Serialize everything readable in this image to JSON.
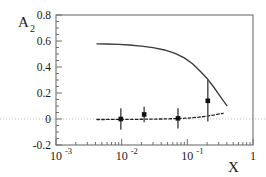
{
  "chart_data": {
    "type": "scatter",
    "title": "",
    "xlabel": "X",
    "ylabel": "A",
    "ylabel_sub": "2",
    "xscale": "log",
    "yscale": "linear",
    "xlim": [
      0.001,
      1.0
    ],
    "ylim": [
      -0.2,
      0.8
    ],
    "grid": false,
    "legend": "none",
    "yticks": [
      "0.8",
      "0.6",
      "0.4",
      "0.2",
      "0",
      "-0.2"
    ],
    "ytick_values": [
      0.8,
      0.6,
      0.4,
      0.2,
      0,
      -0.2
    ],
    "xticks": [
      {
        "label_base": "10",
        "label_exp": "-3",
        "value": 0.001
      },
      {
        "label_base": "10",
        "label_exp": "-2",
        "value": 0.01
      },
      {
        "label_base": "10",
        "label_exp": "-1",
        "value": 0.1
      },
      {
        "label_base": "1",
        "label_exp": "",
        "value": 1.0
      }
    ],
    "series": [
      {
        "name": "data-points",
        "type": "scatter",
        "marker": "filled-square",
        "color": "#111111",
        "points": [
          {
            "x": 0.0097,
            "y": 0.0,
            "yerr": 0.082
          },
          {
            "x": 0.022,
            "y": 0.035,
            "yerr": 0.06
          },
          {
            "x": 0.072,
            "y": 0.005,
            "yerr": 0.078
          },
          {
            "x": 0.205,
            "y": 0.14,
            "yerr": 0.16
          }
        ]
      },
      {
        "name": "solid-theory-curve",
        "type": "line",
        "style": "solid",
        "color": "#333333",
        "x": [
          0.0042,
          0.006,
          0.009,
          0.013,
          0.02,
          0.03,
          0.045,
          0.065,
          0.09,
          0.12,
          0.16,
          0.2,
          0.25,
          0.3,
          0.35,
          0.4
        ],
        "y": [
          0.578,
          0.577,
          0.574,
          0.569,
          0.561,
          0.549,
          0.531,
          0.505,
          0.47,
          0.425,
          0.363,
          0.312,
          0.248,
          0.192,
          0.143,
          0.103
        ]
      },
      {
        "name": "dashed-theory-curve",
        "type": "line",
        "style": "dashed",
        "color": "#222222",
        "x": [
          0.0042,
          0.01,
          0.02,
          0.04,
          0.07,
          0.1,
          0.15,
          0.2,
          0.25,
          0.3,
          0.35
        ],
        "y": [
          -0.004,
          -0.003,
          -0.002,
          0.0,
          0.003,
          0.007,
          0.014,
          0.022,
          0.03,
          0.038,
          0.044
        ]
      },
      {
        "name": "zero-reference-line",
        "type": "line",
        "style": "dotted",
        "color": "#b9b9b9",
        "y_constant": 0
      }
    ]
  }
}
